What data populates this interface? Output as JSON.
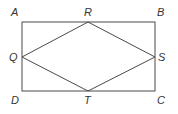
{
  "diagram": {
    "type": "geometry",
    "points": {
      "A": {
        "label": "A",
        "x": 22,
        "y": 22
      },
      "B": {
        "label": "B",
        "x": 155,
        "y": 22
      },
      "C": {
        "label": "C",
        "x": 155,
        "y": 91
      },
      "D": {
        "label": "D",
        "x": 22,
        "y": 91
      },
      "R": {
        "label": "R",
        "x": 88,
        "y": 22
      },
      "S": {
        "label": "S",
        "x": 155,
        "y": 57
      },
      "T": {
        "label": "T",
        "x": 88,
        "y": 91
      },
      "Q": {
        "label": "Q",
        "x": 22,
        "y": 57
      }
    },
    "rectangle": [
      "A",
      "B",
      "C",
      "D"
    ],
    "rhombus": [
      "Q",
      "R",
      "S",
      "T"
    ],
    "colors": {
      "line": "#4a4a4a",
      "text": "#333333",
      "background": "#ffffff"
    }
  }
}
